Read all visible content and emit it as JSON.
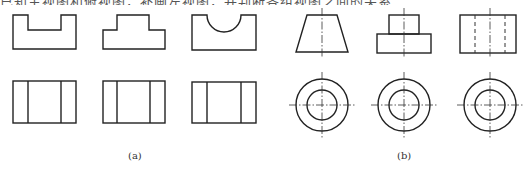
{
  "top_text": "已知主视图和俯视图，补画左视图，并判断各组视图之间的关系",
  "captions": {
    "a": "(a)",
    "b": "(b)"
  },
  "colors": {
    "line": "#222222",
    "centerline": "#333333",
    "background": "#ffffff"
  },
  "group_a": {
    "label": "(a)",
    "front_views": [
      "u-channel",
      "inverted-t-step",
      "semicircular-groove"
    ],
    "top_views": [
      "rectangle-two-lines",
      "rectangle-two-lines",
      "rectangle-two-lines"
    ]
  },
  "group_b": {
    "label": "(b)",
    "front_views": [
      "trapezoid-frustum",
      "stepped-cylinder",
      "cylinder-with-hidden-bore"
    ],
    "top_views": [
      "concentric-circles",
      "concentric-circles",
      "concentric-circles"
    ]
  }
}
